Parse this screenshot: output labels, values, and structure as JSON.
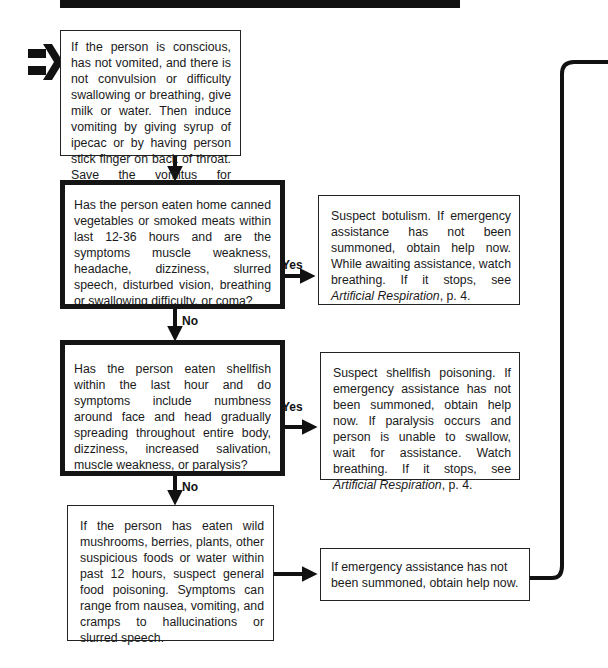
{
  "flowchart": {
    "start_step": {
      "text": "If the person is conscious, has not vomited, and there is not convulsion or difficulty swallowing or breathing, give milk or water. Then induce vomiting by giving syrup of ipecac or by having person stick finger on back of throat. Save the vomitus for evaluation."
    },
    "question_botulism": {
      "text": "Has the person eaten home canned vegetables or smoked meats within last 12-36 hours and are the symptoms muscle weakness, headache, dizziness, slurred speech, disturbed vision, breathing or swallowing difficulty, or coma?",
      "yes_label": "Yes",
      "no_label": "No"
    },
    "answer_botulism": {
      "text": "Suspect botulism. If emergency assistance has not been summoned, obtain help now. While awaiting assistance, watch breathing. If it stops, see ",
      "ref_italic": "Artificial Respiration",
      "ref_suffix": ", p. 4."
    },
    "question_shellfish": {
      "text": "Has the person eaten shellfish within the last hour and do symptoms include numbness around face and head gradually spreading throughout entire body, dizziness, increased salivation, muscle weakness, or paralysis?",
      "yes_label": "Yes",
      "no_label": "No"
    },
    "answer_shellfish": {
      "text": "Suspect shellfish poisoning. If emergency assistance has not been summoned, obtain help now. If paralysis occurs and person is unable to swallow, wait for assistance. Watch breathing. If it stops, see ",
      "ref_italic": "Artificial Respiration",
      "ref_suffix": ", p. 4."
    },
    "general_food_poisoning": {
      "text": "If the person has eaten wild mushrooms, berries, plants, other suspicious foods or water within past 12 hours, suspect general food poisoning. Symptoms can range from nausea, vomiting, and cramps to hallucinations or slurred speech."
    },
    "answer_general": {
      "text": "If emergency assistance has not been summoned, obtain help now."
    }
  },
  "icons": {
    "entry_arrow": "double-line-right-arrow"
  },
  "colors": {
    "ink": "#151515",
    "paper": "#ffffff"
  }
}
